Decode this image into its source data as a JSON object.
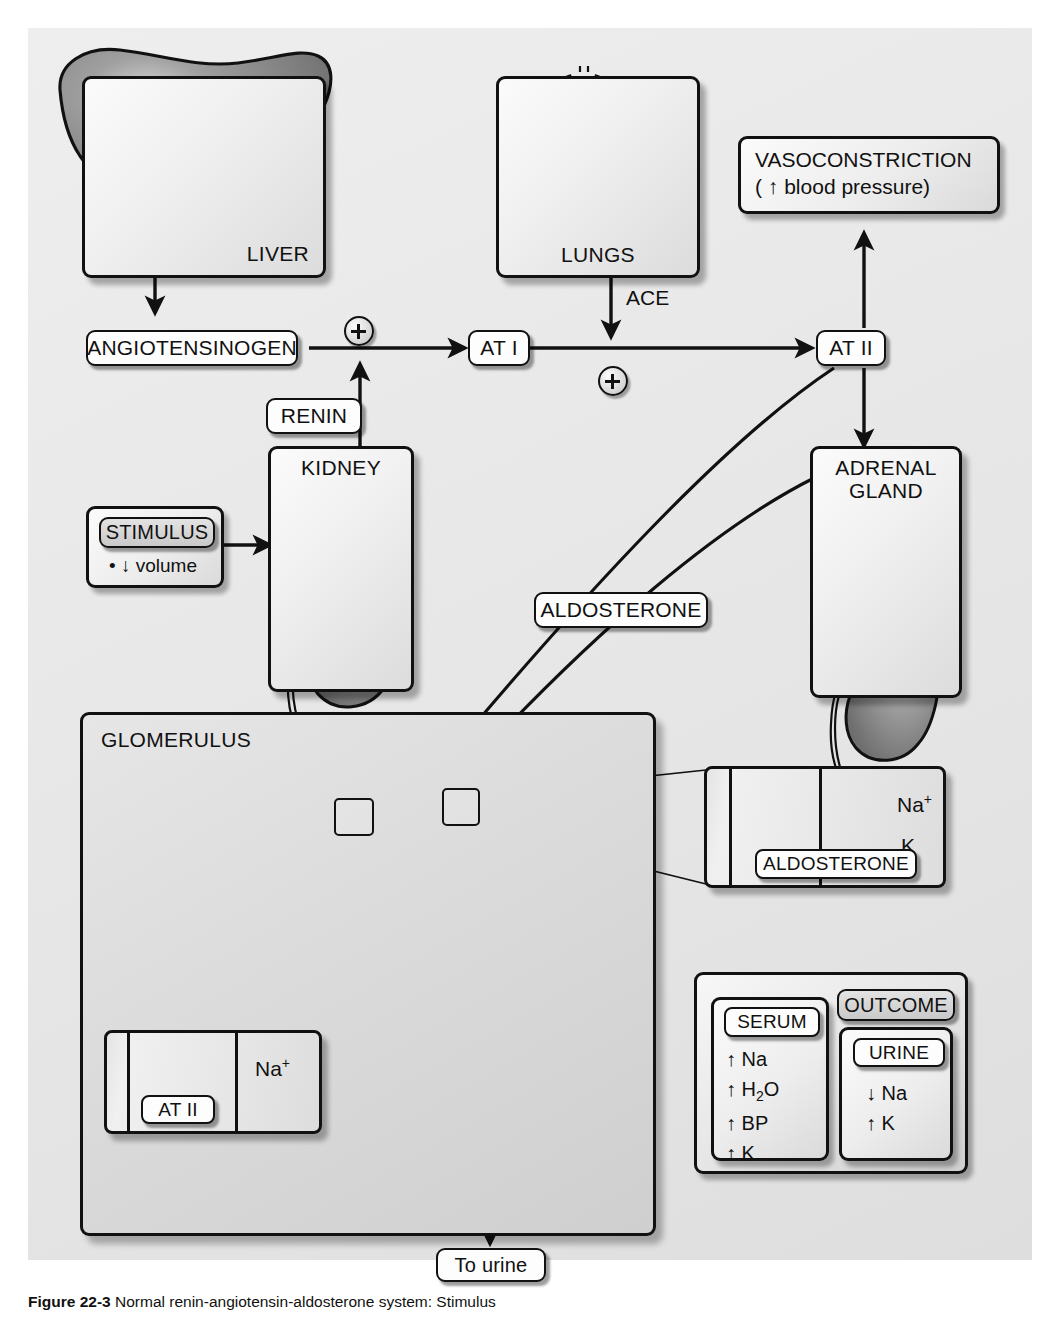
{
  "figure": {
    "caption_label": "Figure 22-3",
    "caption_text": "Normal renin-angiotensin-aldosterone system: Stimulus"
  },
  "colors": {
    "background": "#e6e6e6",
    "panel_fill": "#f1f1f1",
    "organ_mid": "#8e8e8e",
    "organ_dark": "#6f6f6f",
    "tubule_wall": "#9a9a9a",
    "line": "#111111"
  },
  "organs": [
    {
      "id": "liver",
      "label": "LIVER",
      "icon": "liver-organ-icon"
    },
    {
      "id": "lungs",
      "label": "LUNGS",
      "icon": "lungs-organ-icon"
    },
    {
      "id": "kidney",
      "label": "KIDNEY",
      "icon": "kidney-organ-icon"
    },
    {
      "id": "adrenal",
      "label": "ADRENAL\nGLAND",
      "icon": "adrenal-gland-organ-icon"
    }
  ],
  "pathway": {
    "angiotensinogen": "ANGIOTENSINOGEN",
    "renin": "RENIN",
    "at1": "AT I",
    "at2": "AT II",
    "ace": "ACE",
    "aldosterone": "ALDOSTERONE",
    "plus_symbol": "+",
    "plus_count": 2
  },
  "vasoconstriction": {
    "line1": "VASOCONSTRICTION",
    "line2_prefix": "( ",
    "line2_arrow": "↑",
    "line2_text": "blood pressure)"
  },
  "stimulus": {
    "title": "STIMULUS",
    "items": [
      "• ↓ volume"
    ]
  },
  "glomerulus": {
    "label": "GLOMERULUS"
  },
  "inset_at2": {
    "pill": "AT II",
    "transport": [
      {
        "ion": "Na",
        "charge": "+",
        "direction": "right"
      }
    ]
  },
  "inset_aldosterone": {
    "pill": "ALDOSTERONE",
    "transport": [
      {
        "ion": "Na",
        "charge": "+",
        "direction": "right"
      },
      {
        "ion": "K",
        "charge": "",
        "direction": "left"
      }
    ]
  },
  "outcome": {
    "title": "OUTCOME",
    "serum": {
      "title": "SERUM",
      "items": [
        {
          "arrow": "↑",
          "label": "Na"
        },
        {
          "arrow": "↑",
          "label": "H2O"
        },
        {
          "arrow": "↑",
          "label": "BP"
        },
        {
          "arrow": "↑",
          "label": "K"
        }
      ]
    },
    "urine": {
      "title": "URINE",
      "items": [
        {
          "arrow": "↓",
          "label": "Na"
        },
        {
          "arrow": "↑",
          "label": "K"
        }
      ]
    }
  },
  "to_urine": {
    "label": "To urine"
  }
}
